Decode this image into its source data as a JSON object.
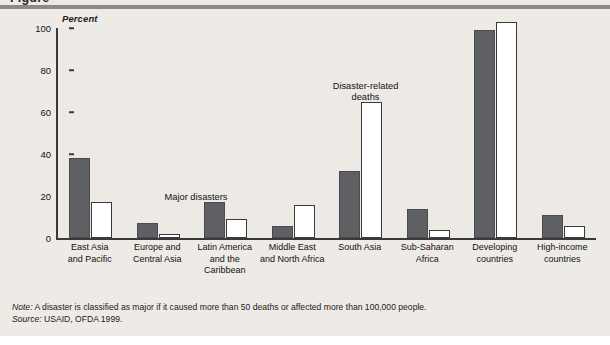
{
  "page": {
    "clipped_title": "Figure"
  },
  "chart_data": {
    "type": "bar",
    "title": "",
    "ylabel": "Percent",
    "xlabel": "",
    "ylim": [
      0,
      100
    ],
    "yticks": [
      0,
      20,
      40,
      60,
      80,
      100
    ],
    "grid": false,
    "legend_position": "in-plot annotations",
    "categories": [
      "East Asia\nand Pacific",
      "Europe and\nCentral Asia",
      "Latin America\nand the\nCaribbean",
      "Middle East\nand North Africa",
      "South Asia",
      "Sub-Saharan\nAfrica",
      "Developing\ncountries",
      "High-income\ncountries"
    ],
    "series": [
      {
        "name": "Major disasters",
        "color": "#5f6063",
        "values": [
          37,
          6,
          16,
          5,
          31,
          13,
          98,
          10
        ]
      },
      {
        "name": "Disaster-related deaths",
        "color": "#ffffff",
        "values": [
          16,
          1,
          8,
          15,
          64,
          3,
          102,
          5
        ]
      }
    ],
    "annotations": [
      {
        "text": "Major disasters",
        "target": "Latin America and the Caribbean"
      },
      {
        "text": "Disaster-related\ndeaths",
        "target": "South Asia"
      }
    ]
  },
  "footer": {
    "note_lead": "Note:",
    "note_text": " A disaster is classified as major if it caused more than 50 deaths or affected more than 100,000 people.",
    "source_lead": "Source:",
    "source_text": " USAID, OFDA 1999."
  }
}
